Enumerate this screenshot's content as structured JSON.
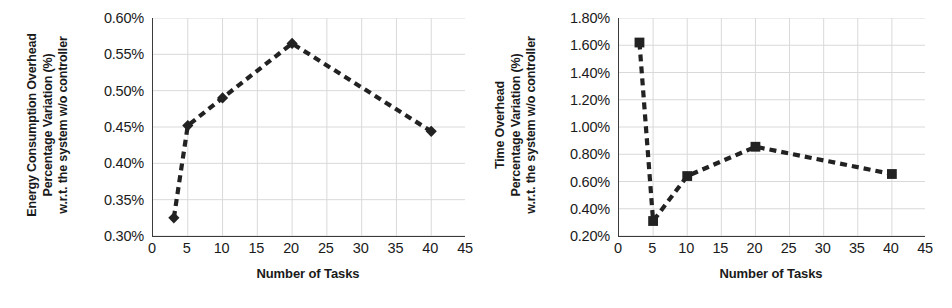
{
  "figure": {
    "panel_count": 2,
    "background_color": "#ffffff",
    "line_color": "#222222",
    "grid_color": "#d9d9d9",
    "axis_color": "#3b3b3b"
  },
  "panels": [
    {
      "name": "energy-consumption-overhead",
      "ytitle_lines": [
        "Energy Consumption Overhead",
        "Percentage Variation (%)",
        "w.r.t. the system w/o controller"
      ],
      "xtitle": "Number of Tasks",
      "yticks": [
        "0.30%",
        "0.35%",
        "0.40%",
        "0.45%",
        "0.50%",
        "0.55%",
        "0.60%"
      ],
      "xticks": [
        "0",
        "5",
        "10",
        "15",
        "20",
        "25",
        "30",
        "35",
        "40",
        "45"
      ]
    },
    {
      "name": "time-overhead",
      "ytitle_lines": [
        "Time Overhead",
        "Percentage Variation (%)",
        "w.r.t. the system w/o controller"
      ],
      "xtitle": "Number of Tasks",
      "yticks": [
        "0.20%",
        "0.40%",
        "0.60%",
        "0.80%",
        "1.00%",
        "1.20%",
        "1.40%",
        "1.60%",
        "1.80%"
      ],
      "xticks": [
        "0",
        "5",
        "10",
        "15",
        "20",
        "25",
        "30",
        "35",
        "40",
        "45"
      ]
    }
  ],
  "chart_data": [
    {
      "type": "line",
      "title": "",
      "xlabel": "Number of Tasks",
      "ylabel": "Energy Consumption Overhead Percentage Variation (%) w.r.t. the system w/o controller",
      "x": [
        3,
        5,
        10,
        20,
        40
      ],
      "values": [
        0.325,
        0.452,
        0.49,
        0.565,
        0.444
      ],
      "series": [
        {
          "name": "Energy consumption overhead",
          "values": [
            0.325,
            0.452,
            0.49,
            0.565,
            0.444
          ]
        }
      ],
      "point_labels": [
        "0.325%",
        "0.452%",
        "0.490%",
        "0.565%",
        "0.444%"
      ],
      "xlim": [
        0,
        45
      ],
      "ylim": [
        0.3,
        0.6
      ],
      "ytick_values": [
        0.3,
        0.35,
        0.4,
        0.45,
        0.5,
        0.55,
        0.6
      ],
      "xtick_values": [
        0,
        5,
        10,
        15,
        20,
        25,
        30,
        35,
        40,
        45
      ],
      "grid": true,
      "legend": false,
      "marker": "diamond",
      "linestyle": "dashed",
      "color": "#222222"
    },
    {
      "type": "line",
      "title": "",
      "xlabel": "Number of Tasks",
      "ylabel": "Time Overhead Percentage Variation (%) w.r.t. the system w/o controller",
      "x": [
        3,
        5,
        10,
        20,
        40
      ],
      "values": [
        1.62,
        0.31,
        0.64,
        0.855,
        0.655
      ],
      "series": [
        {
          "name": "Time overhead",
          "values": [
            1.62,
            0.31,
            0.64,
            0.855,
            0.655
          ]
        }
      ],
      "point_labels": [
        "1.62%",
        "0.31%",
        "0.64%",
        "0.855%",
        "0.655%"
      ],
      "xlim": [
        0,
        45
      ],
      "ylim": [
        0.2,
        1.8
      ],
      "ytick_values": [
        0.2,
        0.4,
        0.6,
        0.8,
        1.0,
        1.2,
        1.4,
        1.6,
        1.8
      ],
      "xtick_values": [
        0,
        5,
        10,
        15,
        20,
        25,
        30,
        35,
        40,
        45
      ],
      "grid": true,
      "legend": false,
      "marker": "square",
      "linestyle": "dashed",
      "color": "#222222"
    }
  ]
}
